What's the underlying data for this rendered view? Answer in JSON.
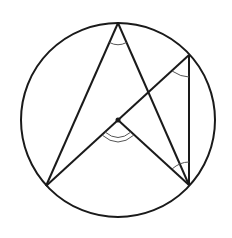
{
  "diagram": {
    "type": "circle-geometry",
    "colors": {
      "stroke": "#1a1a1a",
      "arc": "#555555",
      "background": "#ffffff"
    },
    "circle": {
      "cx": 118,
      "cy": 120,
      "r": 98
    },
    "points": {
      "top": {
        "x": 118,
        "y": 23
      },
      "right_upper": {
        "x": 189,
        "y": 55
      },
      "right_lower": {
        "x": 189,
        "y": 185
      },
      "bottom_left": {
        "x": 46,
        "y": 186
      },
      "center": {
        "x": 118,
        "y": 120
      }
    },
    "segments": [
      [
        "top",
        "bottom_left"
      ],
      [
        "top",
        "right_lower"
      ],
      [
        "bottom_left",
        "right_upper"
      ],
      [
        "center",
        "right_lower"
      ],
      [
        "right_upper",
        "right_lower"
      ]
    ],
    "angle_marks": [
      {
        "vertex": "top",
        "arcs": 1
      },
      {
        "vertex": "right_upper",
        "arcs": 1
      },
      {
        "vertex": "right_lower",
        "arcs": 1
      },
      {
        "vertex": "center",
        "arcs": 2
      }
    ]
  }
}
